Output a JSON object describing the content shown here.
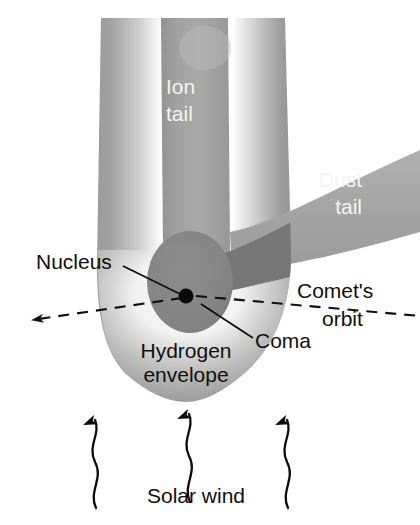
{
  "figure": {
    "background_color": "#ffffff"
  },
  "labels": {
    "ion_tail_line1": "Ion",
    "ion_tail_line2": "tail",
    "dust_tail_line1": "Dust",
    "dust_tail_line2": "tail",
    "nucleus": "Nucleus",
    "coma": "Coma",
    "hydrogen_envelope_line1": "Hydrogen",
    "hydrogen_envelope_line2": "envelope",
    "comet_orbit_line1": "Comet's",
    "comet_orbit_line2": "orbit",
    "solar_wind": "Solar wind"
  },
  "colors": {
    "envelope_edge_gray": "#9a9a98",
    "envelope_highlight": "#fdfdfd",
    "ion_tail_gray": "#9d9d9b",
    "dust_tail_gray": "#a6a6a4",
    "dust_tail_dark": "#77777a",
    "coma_gray": "#848486",
    "nucleus_black": "#0b0b0a",
    "label_dark": "#100f0d",
    "label_light": "#f4f4f2"
  }
}
